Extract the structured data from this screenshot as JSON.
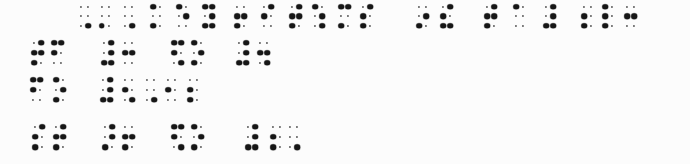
{
  "document": {
    "type": "braille-scan",
    "description": "Four lines of embossed braille; filled positions shown as large dots, empty grid positions as small faint dots"
  },
  "colors": {
    "background": "#fcfcfc",
    "dot_large": "#161616",
    "dot_small": "#3a3a3a"
  },
  "braille": {
    "lines": [
      {
        "y": 6.5,
        "row_pitch": 9.5,
        "cells": [
          {
            "x": 81,
            "dots": [
              6
            ]
          },
          {
            "x": 101.5,
            "dots": [
              3
            ]
          },
          {
            "x": 125,
            "dots": [
              6
            ]
          },
          {
            "x": 153,
            "dots": [
              1,
              3
            ]
          },
          {
            "x": 179,
            "dots": [
              1,
              5
            ]
          },
          {
            "x": 205,
            "dots": [
              1,
              3,
              4,
              5,
              6
            ]
          },
          {
            "x": 237,
            "dots": [
              2,
              3,
              5
            ]
          },
          {
            "x": 264,
            "dots": [
              2,
              4
            ]
          },
          {
            "x": 292,
            "dots": [
              2,
              3,
              4,
              5
            ]
          },
          {
            "x": 315,
            "dots": [
              1,
              5,
              6
            ]
          },
          {
            "x": 341,
            "dots": [
              1,
              3,
              4
            ]
          },
          {
            "x": 363,
            "dots": [
              2,
              3,
              4
            ]
          },
          {
            "x": 419,
            "dots": [
              3,
              5
            ]
          },
          {
            "x": 443,
            "dots": [
              2,
              3,
              4,
              6
            ]
          },
          {
            "x": 487,
            "dots": [
              2,
              3,
              4,
              5
            ]
          },
          {
            "x": 516,
            "dots": [
              1
            ]
          },
          {
            "x": 546,
            "dots": [
              3,
              4,
              5,
              6
            ]
          },
          {
            "x": 584,
            "dots": [
              2,
              3
            ]
          },
          {
            "x": 605,
            "dots": [
              1,
              2,
              3
            ]
          },
          {
            "x": 627,
            "dots": [
              2,
              5
            ]
          }
        ]
      },
      {
        "y": 42.5,
        "row_pitch": 10,
        "cells": [
          {
            "x": 34,
            "dots": [
              2,
              3,
              4,
              5
            ]
          },
          {
            "x": 54,
            "dots": [
              1,
              2,
              4
            ]
          },
          {
            "x": 104,
            "dots": [
              3,
              4,
              5,
              6
            ]
          },
          {
            "x": 125,
            "dots": [
              2,
              5
            ]
          },
          {
            "x": 174,
            "dots": [
              1,
              2,
              4,
              6
            ]
          },
          {
            "x": 194,
            "dots": [
              1,
              3,
              5
            ]
          },
          {
            "x": 239,
            "dots": [
              3,
              4,
              5,
              6
            ]
          },
          {
            "x": 260,
            "dots": [
              2,
              5,
              6
            ]
          }
        ]
      },
      {
        "y": 79.5,
        "row_pitch": 10,
        "cells": [
          {
            "x": 33,
            "dots": [
              1,
              2,
              4
            ]
          },
          {
            "x": 56,
            "dots": [
              1,
              3,
              5
            ]
          },
          {
            "x": 103,
            "dots": [
              3,
              4,
              5,
              6
            ]
          },
          {
            "x": 125,
            "dots": [
              2,
              6
            ]
          },
          {
            "x": 147,
            "dots": [
              6
            ]
          },
          {
            "x": 168,
            "dots": [
              2
            ]
          },
          {
            "x": 190,
            "dots": [
              2,
              3
            ]
          }
        ]
      },
      {
        "y": 126.5,
        "row_pitch": 10.25,
        "cells": [
          {
            "x": 35,
            "dots": [
              2,
              3,
              4
            ]
          },
          {
            "x": 56,
            "dots": [
              2,
              3,
              4,
              5
            ]
          },
          {
            "x": 105,
            "dots": [
              3,
              4,
              5
            ]
          },
          {
            "x": 125,
            "dots": [
              2,
              3,
              5
            ]
          },
          {
            "x": 174,
            "dots": [
              1,
              2,
              4,
              6
            ]
          },
          {
            "x": 194,
            "dots": [
              1,
              3,
              5
            ]
          },
          {
            "x": 248,
            "dots": [
              3,
              4,
              5,
              6
            ]
          },
          {
            "x": 273,
            "dots": [
              2,
              3
            ]
          },
          {
            "x": 290,
            "dots": [
              6
            ]
          }
        ]
      }
    ]
  }
}
